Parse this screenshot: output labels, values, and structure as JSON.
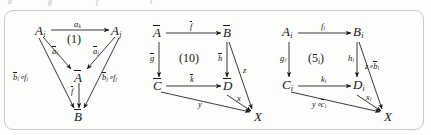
{
  "page": {
    "clipped_top_line": {
      "fragment_1": "a",
      "fragment_2": "g",
      "fragment_3": "f",
      "fragment_4": "i"
    }
  },
  "figure": {
    "diagrams": [
      {
        "id": "diagram-1",
        "region_label": "(1)",
        "nodes": [
          {
            "name": "A-i",
            "base": "A",
            "sub": "i",
            "bar": false
          },
          {
            "name": "A-j",
            "base": "A",
            "sub": "j",
            "bar": false
          },
          {
            "name": "A-bar",
            "base": "A",
            "sub": "",
            "bar": true
          },
          {
            "name": "B-bar",
            "base": "B",
            "sub": "",
            "bar": true
          }
        ],
        "arrows": [
          {
            "name": "a-k",
            "label_base": "a",
            "label_sub": "k",
            "bar": false,
            "from": "A-i",
            "to": "A-j"
          },
          {
            "name": "a-bar-i",
            "label_base": "a",
            "label_sub": "i",
            "bar": true,
            "from": "A-i",
            "to": "A-bar"
          },
          {
            "name": "a-bar-j",
            "label_base": "a",
            "label_sub": "j",
            "bar": true,
            "from": "A-j",
            "to": "A-bar"
          },
          {
            "name": "f-bar",
            "label_base": "f",
            "label_sub": "",
            "bar": true,
            "from": "A-bar",
            "to": "B-bar"
          },
          {
            "name": "b-bar-i-comp-f-i",
            "label_text": "b i ∘f i",
            "bar": true,
            "from": "A-i",
            "to": "B-bar"
          },
          {
            "name": "b-bar-j-comp-f-j",
            "label_text": "b j ∘f j",
            "bar": true,
            "from": "A-j",
            "to": "B-bar"
          }
        ],
        "labels": {
          "a_k": "a",
          "a_k_sub": "k",
          "a_bar_i": "a",
          "a_bar_i_sub": "i",
          "a_bar_j": "a",
          "a_bar_j_sub": "j",
          "f_bar": "f",
          "left_comp_b": "b",
          "left_comp_b_sub": "i",
          "left_comp_op": "∘",
          "left_comp_f": "f",
          "left_comp_f_sub": "i",
          "right_comp_b": "b",
          "right_comp_b_sub": "j",
          "right_comp_op": "∘",
          "right_comp_f": "f",
          "right_comp_f_sub": "j",
          "node_A_i": "A",
          "node_A_i_sub": "i",
          "node_A_j": "A",
          "node_A_j_sub": "j",
          "node_A_bar": "A",
          "node_B_bar": "B"
        }
      },
      {
        "id": "diagram-2",
        "region_label": "(10)",
        "nodes": [
          {
            "name": "A-bar",
            "base": "A",
            "bar": true
          },
          {
            "name": "B-bar",
            "base": "B",
            "bar": true
          },
          {
            "name": "C-bar",
            "base": "C",
            "bar": true
          },
          {
            "name": "D-bar",
            "base": "D",
            "bar": true
          },
          {
            "name": "X",
            "base": "X",
            "bar": false
          }
        ],
        "labels": {
          "f_bar": "f",
          "g_bar": "g",
          "h_bar": "h",
          "k_bar": "k",
          "z": "z",
          "x": "x",
          "y": "y",
          "node_A_bar": "A",
          "node_B_bar": "B",
          "node_C_bar": "C",
          "node_D_bar": "D",
          "node_X": "X"
        }
      },
      {
        "id": "diagram-3",
        "region_label_base": "(5",
        "region_label_sub": "i",
        "region_label_close": ")",
        "nodes": [
          {
            "name": "A-i",
            "base": "A",
            "sub": "i"
          },
          {
            "name": "B-i",
            "base": "B",
            "sub": "i"
          },
          {
            "name": "C-i",
            "base": "C",
            "sub": "i"
          },
          {
            "name": "D-i",
            "base": "D",
            "sub": "i"
          },
          {
            "name": "X",
            "base": "X",
            "sub": ""
          }
        ],
        "labels": {
          "f_i": "f",
          "f_i_sub": "i",
          "g_i": "g",
          "g_i_sub": "i",
          "h_i": "h",
          "h_i_sub": "i",
          "k_i": "k",
          "k_i_sub": "i",
          "z_comp_b_bar_i_z": "z∘",
          "z_comp_b_bar_i_b": "b",
          "z_comp_b_bar_i_sub": "i",
          "x_i": "x",
          "x_i_sub": "i",
          "y_comp_c_bar_i_y": "y∘",
          "y_comp_c_bar_i_c": "c",
          "y_comp_c_bar_i_sub": "i",
          "node_A_i": "A",
          "node_A_i_sub": "i",
          "node_B_i": "B",
          "node_B_i_sub": "i",
          "node_C_i": "C",
          "node_C_i_sub": "i",
          "node_D_i": "D",
          "node_D_i_sub": "i",
          "node_X": "X"
        }
      }
    ]
  },
  "colors": {
    "ink": "#16161a",
    "paper": "#fdfdfc",
    "border": "#c9c9c6",
    "faint_text": "#b9b9b6"
  }
}
